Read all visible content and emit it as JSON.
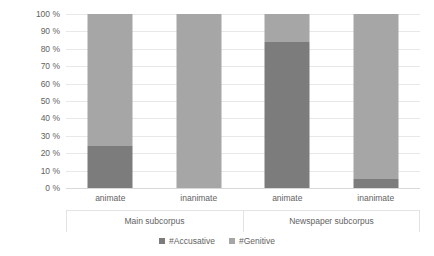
{
  "chart_data": {
    "type": "bar",
    "subtype": "100% stacked bar",
    "title": "",
    "xlabel": "",
    "ylabel": "",
    "ylim": [
      0,
      100
    ],
    "grid": true,
    "legend_position": "bottom",
    "categories": [
      "animate",
      "inanimate",
      "animate",
      "inanimate"
    ],
    "groups": [
      {
        "label": "Main subcorpus",
        "categories": [
          "animate",
          "inanimate"
        ]
      },
      {
        "label": "Newspaper subcorpus",
        "categories": [
          "animate",
          "inanimate"
        ]
      }
    ],
    "yticks": [
      "0 %",
      "10 %",
      "20 %",
      "30 %",
      "40 %",
      "50 %",
      "60 %",
      "70 %",
      "80 %",
      "90 %",
      "100 %"
    ],
    "ytick_values": [
      0,
      10,
      20,
      30,
      40,
      50,
      60,
      70,
      80,
      90,
      100
    ],
    "series": [
      {
        "name": "#Accusative",
        "color": "#7c7c7c",
        "values": [
          24,
          0,
          84,
          5
        ]
      },
      {
        "name": "#Genitive",
        "color": "#a6a6a6",
        "values": [
          76,
          100,
          16,
          95
        ]
      }
    ]
  },
  "legend": {
    "items": [
      {
        "label": "#Accusative",
        "color": "#7c7c7c"
      },
      {
        "label": "#Genitive",
        "color": "#a6a6a6"
      }
    ]
  },
  "axis": {
    "y_ticks": [
      "100 %",
      "90 %",
      "80 %",
      "70 %",
      "60 %",
      "50 %",
      "40 %",
      "30 %",
      "20 %",
      "10 %",
      "0 %"
    ],
    "x_categories": [
      "animate",
      "inanimate",
      "animate",
      "inanimate"
    ],
    "x_groups": [
      "Main subcorpus",
      "Newspaper subcorpus"
    ]
  }
}
